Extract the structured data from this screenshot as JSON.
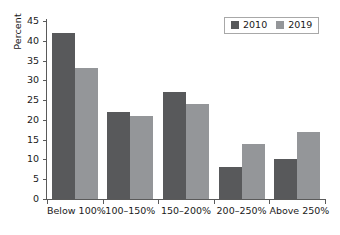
{
  "chart_data": {
    "type": "bar",
    "title": "",
    "xlabel": "",
    "ylabel": "Percent",
    "ylim": [
      0,
      45
    ],
    "yticks": [
      0,
      5,
      10,
      15,
      20,
      25,
      30,
      35,
      40,
      45
    ],
    "grid": false,
    "legend_position": "top-right",
    "categories": [
      "Below 100%",
      "100–150%",
      "150–200%",
      "200–250%",
      "Above 250%"
    ],
    "series": [
      {
        "name": "2010",
        "color": "#58595b",
        "values": [
          42,
          22,
          27,
          8,
          10
        ]
      },
      {
        "name": "2019",
        "color": "#949699",
        "values": [
          33,
          21,
          24,
          14,
          17
        ]
      }
    ]
  },
  "legend": {
    "items": [
      {
        "label": "2010",
        "color": "#58595b"
      },
      {
        "label": "2019",
        "color": "#949699"
      }
    ]
  },
  "axes": {
    "y_title": "Percent",
    "y_tick_labels": [
      "0",
      "5",
      "10",
      "15",
      "20",
      "25",
      "30",
      "35",
      "40",
      "45"
    ],
    "x_tick_labels": [
      "Below 100%",
      "100–150%",
      "150–200%",
      "200–250%",
      "Above 250%"
    ]
  }
}
